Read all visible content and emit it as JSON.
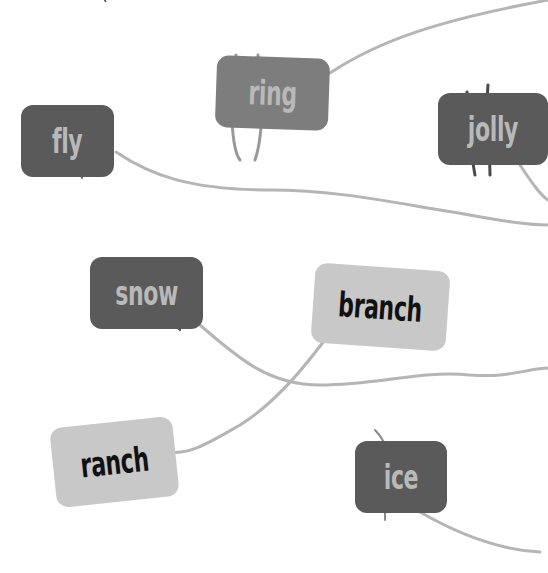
{
  "canvas": {
    "width": 548,
    "height": 573,
    "background": "#ffffff"
  },
  "colors": {
    "dark_card": "#5a5a5a",
    "mid_card": "#7d7d7d",
    "light_card": "#c8c8c8",
    "line": "#b5b5b5",
    "dark_text": "#b9b9b9",
    "light_text": "#111111"
  },
  "top_text_fragment": "cut-off handwritten text (illegible)",
  "cards": [
    {
      "id": "fly",
      "word": "fly",
      "style": "dark"
    },
    {
      "id": "ring",
      "word": "ring",
      "style": "mid"
    },
    {
      "id": "jolly",
      "word": "jolly",
      "style": "dark"
    },
    {
      "id": "snow",
      "word": "snow",
      "style": "dark"
    },
    {
      "id": "branch",
      "word": "branch",
      "style": "light"
    },
    {
      "id": "ranch",
      "word": "ranch",
      "style": "light"
    },
    {
      "id": "ice",
      "word": "ice",
      "style": "dark"
    }
  ],
  "connections": [
    {
      "from": "ring",
      "to": "off-canvas top-right"
    },
    {
      "from": "fly",
      "to": "off-canvas right"
    },
    {
      "from": "snow",
      "to": "off-canvas right"
    },
    {
      "from": "branch",
      "to": "ranch"
    },
    {
      "from": "ice",
      "to": "off-canvas bottom-right"
    },
    {
      "from": "jolly",
      "to": "off-canvas right"
    }
  ]
}
